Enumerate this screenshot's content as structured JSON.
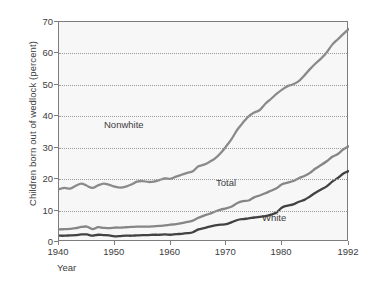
{
  "chart_data": {
    "type": "line",
    "title": "",
    "xlabel": "Year",
    "ylabel": "Children born out of wedlock (percent)",
    "xlim": [
      1940,
      1992
    ],
    "ylim": [
      0,
      70
    ],
    "xticks": [
      1940,
      1950,
      1960,
      1970,
      1980,
      1992
    ],
    "xticklabels": [
      "1940",
      "1950",
      "1960",
      "1970",
      "1980",
      "1992"
    ],
    "yticks": [
      0,
      10,
      20,
      30,
      40,
      50,
      60,
      70
    ],
    "yticklabels": [
      "0",
      "10",
      "20",
      "30",
      "40",
      "50",
      "60",
      "70"
    ],
    "grid": "horizontal-dotted",
    "legend_position": "inline-annotations",
    "x": [
      1940,
      1941,
      1942,
      1943,
      1944,
      1945,
      1946,
      1947,
      1948,
      1949,
      1950,
      1951,
      1952,
      1953,
      1954,
      1955,
      1956,
      1957,
      1958,
      1959,
      1960,
      1961,
      1962,
      1963,
      1964,
      1965,
      1966,
      1967,
      1968,
      1969,
      1970,
      1971,
      1972,
      1973,
      1974,
      1975,
      1976,
      1977,
      1978,
      1979,
      1980,
      1981,
      1982,
      1983,
      1984,
      1985,
      1986,
      1987,
      1988,
      1989,
      1990,
      1991,
      1992
    ],
    "series": [
      {
        "name": "Nonwhite",
        "color": "#8a8a8a",
        "values": [
          16.8,
          17.2,
          17.0,
          17.9,
          18.6,
          17.9,
          17.2,
          18.0,
          18.6,
          18.2,
          17.6,
          17.3,
          17.6,
          18.3,
          19.2,
          19.4,
          19.1,
          19.2,
          19.7,
          20.2,
          20.1,
          20.8,
          21.4,
          22.0,
          22.5,
          24.1,
          24.6,
          25.5,
          26.6,
          28.3,
          30.5,
          32.9,
          35.8,
          38.0,
          40.0,
          41.2,
          42.0,
          44.0,
          45.5,
          47.1,
          48.5,
          49.6,
          50.2,
          51.2,
          53.0,
          55.0,
          56.8,
          58.4,
          60.3,
          62.8,
          64.5,
          66.2,
          67.8
        ]
      },
      {
        "name": "Total",
        "color": "#868686",
        "values": [
          4.0,
          4.1,
          4.2,
          4.4,
          4.8,
          4.9,
          4.1,
          4.7,
          4.5,
          4.4,
          4.6,
          4.6,
          4.7,
          4.8,
          4.9,
          4.9,
          4.9,
          5.0,
          5.1,
          5.3,
          5.5,
          5.7,
          6.0,
          6.4,
          6.8,
          7.7,
          8.4,
          9.0,
          9.7,
          10.3,
          10.7,
          11.3,
          12.4,
          13.0,
          13.2,
          14.2,
          14.8,
          15.5,
          16.3,
          17.1,
          18.4,
          18.9,
          19.4,
          20.3,
          21.0,
          22.0,
          23.4,
          24.5,
          25.7,
          27.1,
          28.0,
          29.5,
          30.5
        ]
      },
      {
        "name": "White",
        "color": "#424242",
        "values": [
          2.0,
          2.0,
          2.1,
          2.2,
          2.4,
          2.4,
          2.0,
          2.3,
          2.2,
          2.1,
          1.8,
          1.9,
          2.0,
          2.0,
          2.1,
          2.2,
          2.2,
          2.3,
          2.3,
          2.4,
          2.3,
          2.5,
          2.6,
          2.8,
          3.1,
          4.0,
          4.4,
          4.9,
          5.3,
          5.5,
          5.7,
          6.3,
          7.0,
          7.3,
          7.5,
          7.8,
          8.0,
          8.2,
          8.7,
          9.4,
          11.0,
          11.6,
          12.0,
          12.8,
          13.4,
          14.5,
          15.7,
          16.7,
          17.7,
          19.2,
          20.4,
          21.8,
          22.6
        ]
      }
    ]
  }
}
